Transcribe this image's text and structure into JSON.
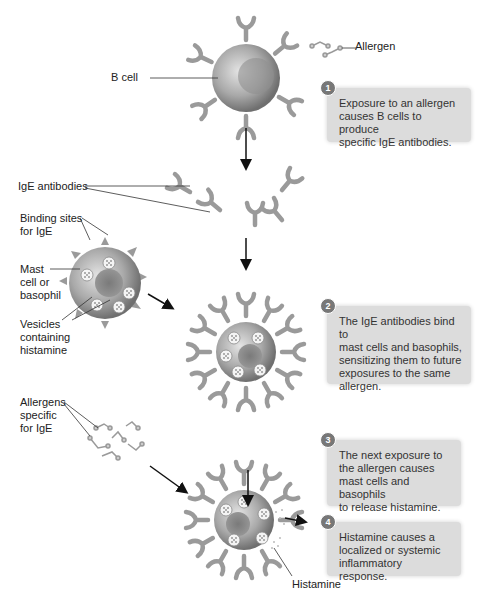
{
  "labels": {
    "allergen": "Allergen",
    "b_cell": "B cell",
    "ige_antibodies": "IgE antibodies",
    "binding_sites": [
      "Binding sites",
      "for IgE"
    ],
    "mast_cell": [
      "Mast",
      "cell or",
      "basophil"
    ],
    "vesicles": [
      "Vesicles",
      "containing",
      "histamine"
    ],
    "allergens_specific": [
      "Allergens",
      "specific",
      "for IgE"
    ],
    "histamine": "Histamine"
  },
  "steps": [
    {
      "number": "1",
      "lines": [
        "Exposure to an allergen",
        "causes B cells to produce",
        "specific IgE antibodies."
      ]
    },
    {
      "number": "2",
      "lines": [
        "The IgE antibodies bind to",
        "mast cells and basophils,",
        "sensitizing them to future",
        "exposures to the same",
        "allergen."
      ]
    },
    {
      "number": "3",
      "lines": [
        "The next exposure to",
        "the allergen causes",
        "mast cells and basophils",
        "to release histamine."
      ]
    },
    {
      "number": "4",
      "lines": [
        "Histamine causes a",
        "localized or systemic",
        "inflammatory response."
      ]
    }
  ],
  "colors": {
    "antibody": "#9a9a9a",
    "cell": "#a8a8a8",
    "step_box": "#dcdcdc",
    "badge": "#777777"
  }
}
